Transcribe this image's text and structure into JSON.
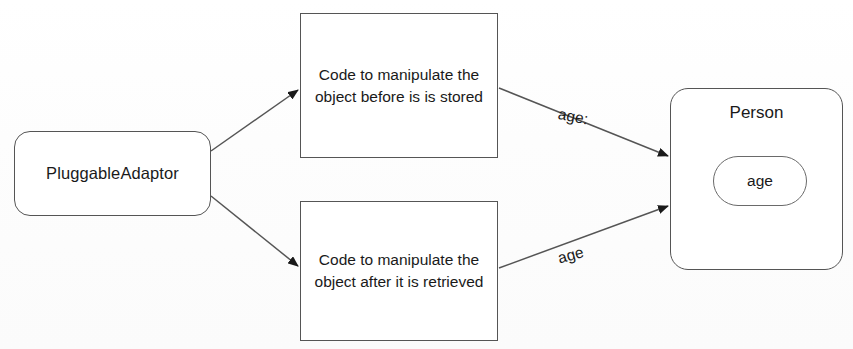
{
  "diagram": {
    "type": "flow-diagram",
    "title": "PluggableAdaptor",
    "background_color": "#fefefe",
    "stroke_color": "#555555",
    "text_color": "#1a1a1a",
    "nodes": [
      {
        "id": "pluggable-adaptor",
        "label": "PluggableAdaptor",
        "shape": "rounded-rectangle"
      },
      {
        "id": "code-before",
        "label": "Code to manipulate the object before is is stored",
        "shape": "rectangle"
      },
      {
        "id": "code-after",
        "label": "Code to manipulate the object after it is retrieved",
        "shape": "rectangle"
      },
      {
        "id": "person",
        "label": "Person",
        "shape": "rounded-rectangle",
        "attribute": "age"
      }
    ],
    "edges": [
      {
        "id": "adaptor-to-before",
        "from": "pluggable-adaptor",
        "to": "code-before",
        "label": "",
        "arrow": "filled-triangle"
      },
      {
        "id": "adaptor-to-after",
        "from": "pluggable-adaptor",
        "to": "code-after",
        "label": "",
        "arrow": "filled-triangle"
      },
      {
        "id": "before-to-person",
        "from": "code-before",
        "to": "person",
        "label": "age:",
        "arrow": "filled-triangle"
      },
      {
        "id": "after-to-person",
        "from": "code-after",
        "to": "person",
        "label": "age",
        "arrow": "filled-triangle"
      }
    ]
  }
}
